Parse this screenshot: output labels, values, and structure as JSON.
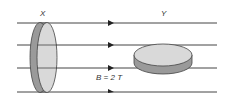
{
  "labels": {
    "disc_x": "X",
    "disc_y": "Y",
    "field": "B = 2 T"
  },
  "field_lines": [
    {
      "y": 23,
      "arrow_x": 112
    },
    {
      "y": 45,
      "arrow_x": 112
    },
    {
      "y": 68,
      "arrow_x": 112
    },
    {
      "y": 92,
      "arrow_x": 112
    }
  ],
  "colors": {
    "line": "#444444",
    "disc_face": "#d9d9d9",
    "disc_rim": "#9a9a9a"
  }
}
